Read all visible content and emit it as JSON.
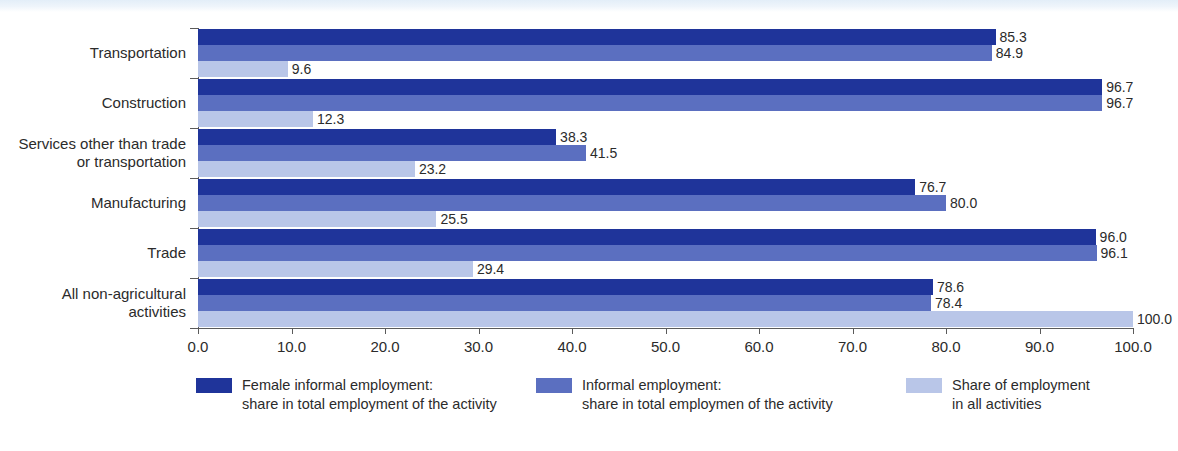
{
  "chart_data": {
    "type": "bar",
    "orientation": "horizontal",
    "title": "",
    "xlabel": "",
    "ylabel": "",
    "xlim": [
      0.0,
      100.0
    ],
    "grid": false,
    "legend_position": "bottom",
    "xticks": [
      "0.0",
      "10.0",
      "20.0",
      "30.0",
      "40.0",
      "50.0",
      "60.0",
      "70.0",
      "80.0",
      "90.0",
      "100.0"
    ],
    "xtick_values": [
      0,
      10,
      20,
      30,
      40,
      50,
      60,
      70,
      80,
      90,
      100
    ],
    "categories": [
      "Transportation",
      "Construction",
      "Services other than trade\nor transportation",
      "Manufacturing",
      "Trade",
      "All non-agricultural\nactivities"
    ],
    "series": [
      {
        "name": "Female informal employment:\nshare in total employment of the activity",
        "color": "#1f349a",
        "values": [
          85.3,
          96.7,
          38.3,
          76.7,
          96.0,
          78.6
        ],
        "labels": [
          "85.3",
          "96.7",
          "38.3",
          "76.7",
          "96.0",
          "78.6"
        ]
      },
      {
        "name": "Informal employment:\nshare in total employmen of the activity",
        "color": "#5b6fc0",
        "values": [
          84.9,
          96.7,
          41.5,
          80.0,
          96.1,
          78.4
        ],
        "labels": [
          "84.9",
          "96.7",
          "41.5",
          "80.0",
          "96.1",
          "78.4"
        ]
      },
      {
        "name": "Share of employment\nin all activities",
        "color": "#b9c6e8",
        "values": [
          9.6,
          12.3,
          23.2,
          25.5,
          29.4,
          100.0
        ],
        "labels": [
          "9.6",
          "12.3",
          "23.2",
          "25.5",
          "29.4",
          "100.0"
        ]
      }
    ]
  },
  "legend": {
    "items": [
      {
        "label": "Female informal employment:\nshare in total employment of the activity",
        "color": "#1f349a"
      },
      {
        "label": "Informal employment:\nshare in total employmen of the activity",
        "color": "#5b6fc0"
      },
      {
        "label": "Share of employment\nin all activities",
        "color": "#b9c6e8"
      }
    ]
  }
}
